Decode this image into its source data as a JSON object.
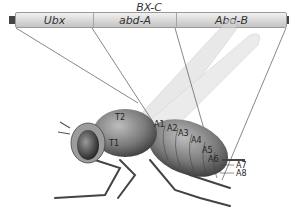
{
  "diagram": {
    "title": "BX-C",
    "genes": [
      {
        "name": "Ubx",
        "width": 77
      },
      {
        "name": "abd-A",
        "width": 83
      },
      {
        "name": "Abd-B",
        "width": 112
      }
    ],
    "segment_labels": {
      "T1": "T1",
      "T2": "T2",
      "A1": "A1",
      "A2": "A2",
      "A3": "A3",
      "A4": "A4",
      "A5": "A5",
      "A6": "A6",
      "A7": "A7",
      "A8": "A8"
    },
    "colors": {
      "bar_light": "#f2f2f2",
      "bar_dark": "#c4c4c4",
      "line": "#555555",
      "body": "#6a6a6a",
      "wing": "#d8d8d8"
    }
  }
}
